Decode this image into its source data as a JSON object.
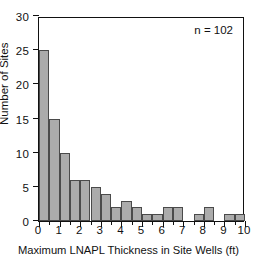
{
  "chart_data": {
    "type": "bar",
    "title": "",
    "xlabel": "Maximum LNAPL Thickness in Site Wells (ft)",
    "ylabel": "Number of Sites",
    "xlim": [
      0,
      10
    ],
    "ylim": [
      0,
      30
    ],
    "bin_width": 0.5,
    "grid": false,
    "legend": null,
    "annotations": [
      {
        "name": "sample-size",
        "text": "n = 102"
      }
    ],
    "xticks": [
      0,
      1,
      2,
      3,
      4,
      5,
      6,
      7,
      8,
      9,
      10
    ],
    "xtick_labels": [
      "0",
      "1",
      "2",
      "3",
      "4",
      "5",
      "6",
      "7",
      "8",
      "9",
      "10"
    ],
    "xminor_ticks": [
      0.5,
      1.5,
      2.5,
      3.5,
      4.5,
      5.5,
      6.5,
      7.5,
      8.5,
      9.5
    ],
    "yticks": [
      0,
      5,
      10,
      15,
      20,
      25,
      30
    ],
    "ytick_labels": [
      "0",
      "5",
      "10",
      "15",
      "20",
      "25",
      "30"
    ],
    "bin_starts": [
      0,
      0.5,
      1,
      1.5,
      2,
      2.5,
      3,
      3.5,
      4,
      4.5,
      5,
      5.5,
      6,
      6.5,
      7,
      7.5,
      8,
      8.5,
      9,
      9.5
    ],
    "categories": [
      "0-0.5",
      "0.5-1",
      "1-1.5",
      "1.5-2",
      "2-2.5",
      "2.5-3",
      "3-3.5",
      "3.5-4",
      "4-4.5",
      "4.5-5",
      "5-5.5",
      "5.5-6",
      "6-6.5",
      "6.5-7",
      "7-7.5",
      "7.5-8",
      "8-8.5",
      "8.5-9",
      "9-9.5",
      "9.5-10"
    ],
    "values": [
      25,
      15,
      10,
      6,
      6,
      5,
      4,
      2,
      3,
      2,
      1,
      1,
      2,
      2,
      0,
      1,
      2,
      0,
      1,
      1
    ],
    "total": 102,
    "bar_color": "#ababab",
    "bar_edge_color": "#4a4a4a",
    "axis_color": "#111111",
    "background_color": "#ffffff"
  }
}
